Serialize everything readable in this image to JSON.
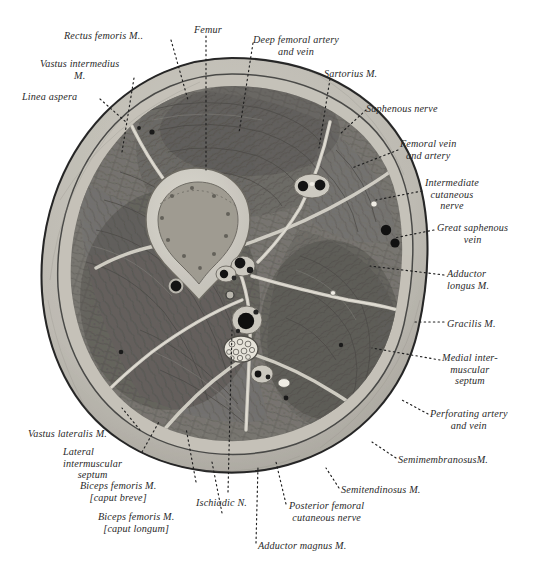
{
  "figure": {
    "kind": "anatomical-cross-section",
    "background_color": "#ffffff",
    "palette": {
      "skin_fascia": "#b9b6ae",
      "subcutaneous": "#c8c5bd",
      "muscle_dark": "#6f6d68",
      "muscle_mid": "#807e78",
      "bone_cortex": "#cfcdc4",
      "bone_marrow": "#9b9890",
      "septum": "#d6d3ca",
      "vessel_dark": "#1d1d1d",
      "outline": "#3a3a3a",
      "leader": "#222222",
      "text": "#2a2a2a"
    }
  },
  "labels": [
    {
      "id": "rectus-femoris",
      "lines": [
        "Rectus femoris M.."
      ],
      "x": 64,
      "y": 30,
      "align": "left",
      "bold_first_word": true
    },
    {
      "id": "femur",
      "lines": [
        "Femur"
      ],
      "x": 194,
      "y": 24,
      "align": "left",
      "bold_first_word": false
    },
    {
      "id": "deep-femoral-artery-vein",
      "lines": [
        "Deep femoral artery",
        "and vein"
      ],
      "x": 253,
      "y": 34,
      "align": "left",
      "bold_first_word": true
    },
    {
      "id": "vastus-intermedius",
      "lines": [
        "Vastus intermedius",
        "M."
      ],
      "x": 40,
      "y": 58,
      "align": "left",
      "bold_first_word": true
    },
    {
      "id": "sartorius",
      "lines": [
        "Sartorius M."
      ],
      "x": 324,
      "y": 68,
      "align": "left",
      "bold_first_word": false
    },
    {
      "id": "linea-aspera",
      "lines": [
        "Linea aspera"
      ],
      "x": 22,
      "y": 91,
      "align": "left",
      "bold_first_word": true
    },
    {
      "id": "saphenous-nerve",
      "lines": [
        "Saphenous nerve"
      ],
      "x": 366,
      "y": 103,
      "align": "left",
      "bold_first_word": false
    },
    {
      "id": "femoral-vein-artery",
      "lines": [
        "Femoral vein",
        "and artery"
      ],
      "x": 400,
      "y": 138,
      "align": "left",
      "bold_first_word": false
    },
    {
      "id": "intermediate-cutaneous-nerve",
      "lines": [
        "Intermediate",
        "cutaneous",
        "nerve"
      ],
      "x": 425,
      "y": 177,
      "align": "left",
      "bold_first_word": false
    },
    {
      "id": "great-saphenous-vein",
      "lines": [
        "Great saphenous",
        "vein"
      ],
      "x": 437,
      "y": 222,
      "align": "left",
      "bold_first_word": false
    },
    {
      "id": "adductor-longus",
      "lines": [
        "Adductor",
        "longus M."
      ],
      "x": 447,
      "y": 268,
      "align": "left",
      "bold_first_word": false
    },
    {
      "id": "gracilis",
      "lines": [
        "Gracilis M."
      ],
      "x": 447,
      "y": 318,
      "align": "left",
      "bold_first_word": false
    },
    {
      "id": "medial-intermuscular-septum",
      "lines": [
        "Medial inter-",
        "muscular",
        "septum"
      ],
      "x": 442,
      "y": 352,
      "align": "left",
      "bold_first_word": false
    },
    {
      "id": "perforating-artery-vein",
      "lines": [
        "Perforating artery",
        "and vein"
      ],
      "x": 430,
      "y": 408,
      "align": "left",
      "bold_first_word": false
    },
    {
      "id": "semimembranosus",
      "lines": [
        "SemimembranosusM."
      ],
      "x": 398,
      "y": 454,
      "align": "left",
      "bold_first_word": false
    },
    {
      "id": "vastus-lateralis",
      "lines": [
        "Vastus lateralis M."
      ],
      "x": 28,
      "y": 428,
      "align": "left",
      "bold_first_word": false
    },
    {
      "id": "lateral-intermuscular-septum",
      "lines": [
        "Lateral",
        "intermuscular",
        "septum"
      ],
      "x": 63,
      "y": 446,
      "align": "left",
      "bold_first_word": false
    },
    {
      "id": "biceps-femoris-breve",
      "lines": [
        "Biceps femoris M.",
        "[caput breve]"
      ],
      "x": 80,
      "y": 480,
      "align": "left",
      "bold_first_word": false
    },
    {
      "id": "ischiadic-nerve",
      "lines": [
        "Ischiadic N."
      ],
      "x": 196,
      "y": 497,
      "align": "left",
      "bold_first_word": false
    },
    {
      "id": "semitendinosus",
      "lines": [
        "Semitendinosus M."
      ],
      "x": 341,
      "y": 484,
      "align": "left",
      "bold_first_word": false
    },
    {
      "id": "posterior-femoral-cutaneous-nerve",
      "lines": [
        "Posterior femoral",
        "cutaneous nerve"
      ],
      "x": 289,
      "y": 500,
      "align": "left",
      "bold_first_word": false
    },
    {
      "id": "biceps-femoris-longum",
      "lines": [
        "Biceps femoris M.",
        "[caput longum]"
      ],
      "x": 98,
      "y": 511,
      "align": "left",
      "bold_first_word": false
    },
    {
      "id": "adductor-magnus",
      "lines": [
        "Adductor magnus M."
      ],
      "x": 258,
      "y": 540,
      "align": "left",
      "bold_first_word": false
    }
  ],
  "leaders": [
    {
      "id": "leader-rectus-femoris",
      "from": [
        171,
        40
      ],
      "to": [
        188,
        100
      ]
    },
    {
      "id": "leader-femur",
      "from": [
        206,
        36
      ],
      "to": [
        206,
        170
      ]
    },
    {
      "id": "leader-deep-femoral",
      "from": [
        253,
        43
      ],
      "to": [
        239,
        133
      ]
    },
    {
      "id": "leader-vastus-intermedius",
      "from": [
        134,
        78
      ],
      "to": [
        122,
        152
      ]
    },
    {
      "id": "leader-sartorius",
      "from": [
        330,
        79
      ],
      "to": [
        319,
        148
      ]
    },
    {
      "id": "leader-linea-aspera",
      "from": [
        100,
        99
      ],
      "to": [
        126,
        122
      ]
    },
    {
      "id": "leader-saphenous-nerve",
      "from": [
        366,
        110
      ],
      "to": [
        340,
        134
      ]
    },
    {
      "id": "leader-femoral-vein-artery",
      "from": [
        398,
        150
      ],
      "to": [
        352,
        168
      ]
    },
    {
      "id": "leader-intermediate-cutaneous",
      "from": [
        422,
        191
      ],
      "to": [
        376,
        200
      ]
    },
    {
      "id": "leader-great-saphenous-vein",
      "from": [
        434,
        230
      ],
      "to": [
        394,
        238
      ]
    },
    {
      "id": "leader-adductor-longus",
      "from": [
        444,
        275
      ],
      "to": [
        370,
        266
      ]
    },
    {
      "id": "leader-gracilis",
      "from": [
        444,
        322
      ],
      "to": [
        414,
        322
      ]
    },
    {
      "id": "leader-medial-septum",
      "from": [
        440,
        360
      ],
      "to": [
        372,
        348
      ]
    },
    {
      "id": "leader-perforating",
      "from": [
        428,
        414
      ],
      "to": [
        402,
        400
      ]
    },
    {
      "id": "leader-semimembranosus",
      "from": [
        396,
        458
      ],
      "to": [
        372,
        442
      ]
    },
    {
      "id": "leader-vastus-lateralis",
      "from": [
        140,
        430
      ],
      "to": [
        122,
        408
      ]
    },
    {
      "id": "leader-lateral-septum",
      "from": [
        142,
        452
      ],
      "to": [
        160,
        420
      ]
    },
    {
      "id": "leader-biceps-breve",
      "from": [
        196,
        482
      ],
      "to": [
        186,
        428
      ]
    },
    {
      "id": "leader-ischiadic",
      "from": [
        228,
        492
      ],
      "to": [
        232,
        330
      ]
    },
    {
      "id": "leader-semitendinosus",
      "from": [
        339,
        488
      ],
      "to": [
        326,
        468
      ]
    },
    {
      "id": "leader-posterior-femoral",
      "from": [
        286,
        504
      ],
      "to": [
        276,
        462
      ]
    },
    {
      "id": "leader-biceps-longum",
      "from": [
        222,
        513
      ],
      "to": [
        212,
        462
      ]
    },
    {
      "id": "leader-adductor-magnus",
      "from": [
        256,
        543
      ],
      "to": [
        258,
        466
      ]
    }
  ]
}
